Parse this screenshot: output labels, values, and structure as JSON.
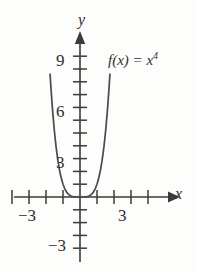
{
  "figure": {
    "background_color": "#fdfdfc",
    "stroke_color": "#3a3a3a",
    "text_color": "#2e2e2e"
  },
  "chart_data": {
    "type": "line",
    "title": "",
    "function_label": "f(x) = x",
    "function_exponent": "4",
    "equation": "f(x) = x^4",
    "xlabel": "x",
    "ylabel": "y",
    "xlim": [
      -4.7,
      5.6
    ],
    "ylim": [
      -4.2,
      10.8
    ],
    "grid": false,
    "legend": "none",
    "x_tick_labels": [
      "-3",
      "3"
    ],
    "y_tick_labels": [
      "9",
      "6",
      "3",
      "-3"
    ],
    "x_ticks_major": [
      -3,
      3
    ],
    "x_ticks_all": [
      -4,
      -3,
      -2,
      -1,
      1,
      2,
      3,
      4
    ],
    "y_ticks_all": [
      1,
      2,
      3,
      4,
      5,
      6,
      7,
      8,
      9,
      -1,
      -2,
      -3
    ],
    "axis_arrows": [
      "x-right",
      "y-up"
    ],
    "series": [
      {
        "name": "f(x) = x^4",
        "x": [
          -1.76,
          -1.7,
          -1.6,
          -1.5,
          -1.4,
          -1.3,
          -1.2,
          -1.1,
          -1.0,
          -0.9,
          -0.8,
          -0.7,
          -0.6,
          -0.5,
          -0.4,
          -0.3,
          -0.2,
          -0.1,
          0,
          0.1,
          0.2,
          0.3,
          0.4,
          0.5,
          0.6,
          0.7,
          0.8,
          0.9,
          1.0,
          1.1,
          1.2,
          1.3,
          1.4,
          1.5,
          1.6,
          1.7,
          1.76
        ],
        "values": [
          9.6,
          8.35,
          6.55,
          5.06,
          3.84,
          2.86,
          2.07,
          1.46,
          1.0,
          0.66,
          0.41,
          0.24,
          0.13,
          0.06,
          0.026,
          0.008,
          0.0016,
          0.0001,
          0,
          0.0001,
          0.0016,
          0.008,
          0.026,
          0.06,
          0.13,
          0.24,
          0.41,
          0.66,
          1.0,
          1.46,
          2.07,
          2.86,
          3.84,
          5.06,
          6.55,
          8.35,
          9.6
        ]
      }
    ]
  },
  "labels": {
    "y_9": "9",
    "y_6": "6",
    "y_3": "3",
    "y_neg3": "−3",
    "x_neg3": "−3",
    "x_3": "3",
    "axis_y": "y",
    "axis_x": "x",
    "fn_text": "f(x) = x",
    "fn_exp": "4"
  }
}
